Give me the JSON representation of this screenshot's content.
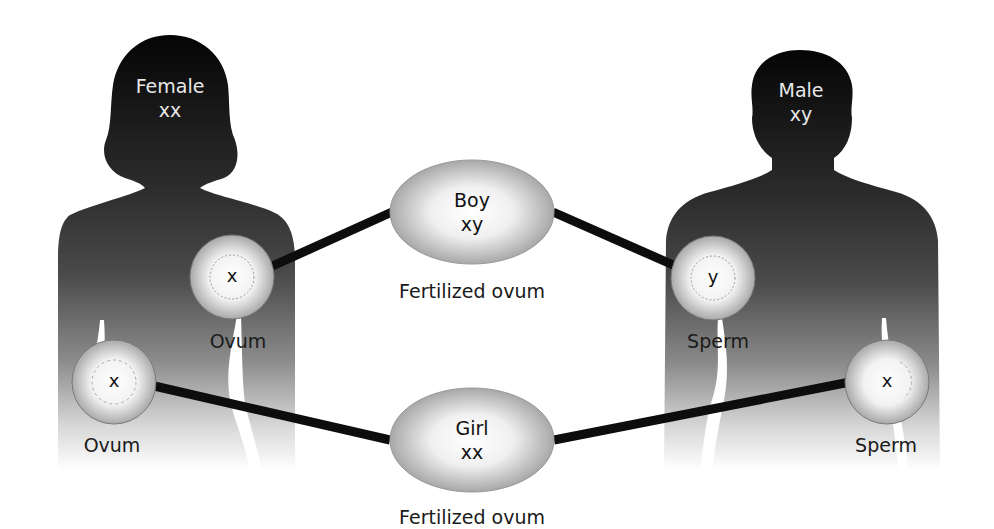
{
  "female": {
    "title": "Female",
    "chromosomes": "xx"
  },
  "male": {
    "title": "Male",
    "chromosomes": "xy"
  },
  "gametes": {
    "female_upper": {
      "label": "Ovum",
      "chromosome": "x"
    },
    "female_lower": {
      "label": "Ovum",
      "chromosome": "x"
    },
    "male_upper": {
      "label": "Sperm",
      "chromosome": "y"
    },
    "male_lower": {
      "label": "Sperm",
      "chromosome": "x"
    }
  },
  "offspring": {
    "boy": {
      "title": "Boy",
      "chromosomes": "xy",
      "caption": "Fertilized ovum"
    },
    "girl": {
      "title": "Girl",
      "chromosomes": "xx",
      "caption": "Fertilized ovum"
    }
  },
  "colors": {
    "silhouette_top": "#0a0a0a",
    "silhouette_mid": "#555555",
    "silhouette_bottom": "#ffffff",
    "connector": "#0d0d0d",
    "cell_center": "#ffffff",
    "cell_edge": "#b8b8b8"
  }
}
